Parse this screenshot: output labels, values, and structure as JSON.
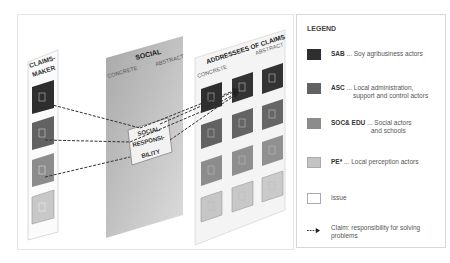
{
  "diagram": {
    "claims_maker": {
      "title_line1": "CLAIMS-",
      "title_line2": "MAKER",
      "boxes": [
        "SAB",
        "ASC",
        "SOC& EDU",
        "PE*"
      ]
    },
    "social_panel": {
      "title": "SOCIAL",
      "left_label": "CONCRETE",
      "right_label": "ABSTRACT"
    },
    "social_responsibility": {
      "line1": "SOCIAL",
      "line2": "RESPONSI-",
      "line3": "BILITY"
    },
    "addressees_panel": {
      "title": "ADDRESSEES OF CLAIMS",
      "left_label": "CONCRETE",
      "right_label": "ABSTRACT",
      "grid_rows": [
        "SAB",
        "ASC",
        "SOC& EDU",
        "PE*"
      ],
      "grid_cols": 3
    }
  },
  "legend": {
    "title": "LEGEND",
    "items": [
      {
        "code": "SAB",
        "sep": " ... ",
        "desc": "Soy agribusiness actors",
        "desc2": "",
        "color": "#2e2e2e"
      },
      {
        "code": "ASC",
        "sep": " ... ",
        "desc": "Local administration,",
        "desc2": "support and control actors",
        "color": "#626262"
      },
      {
        "code": "SOC& EDU",
        "sep": " ... ",
        "desc": "Social actors",
        "desc2": "and schools",
        "color": "#8c8c8c"
      },
      {
        "code": "PE*",
        "sep": " ... ",
        "desc": "Local perception actors",
        "desc2": "",
        "color": "#c4c4c4"
      },
      {
        "code": "",
        "sep": "",
        "desc": "Issue",
        "desc2": "",
        "color": "#ffffff"
      },
      {
        "code": "",
        "sep": "",
        "desc": "Claim: responsibility for solving",
        "desc2": "problems",
        "color": ""
      }
    ]
  },
  "colors": {
    "sab": "#2e2e2e",
    "asc": "#626262",
    "soc_edu": "#8c8c8c",
    "pe": "#c4c4c4",
    "social_panel": "#b4b4b4",
    "dashed_line": "#333333"
  }
}
